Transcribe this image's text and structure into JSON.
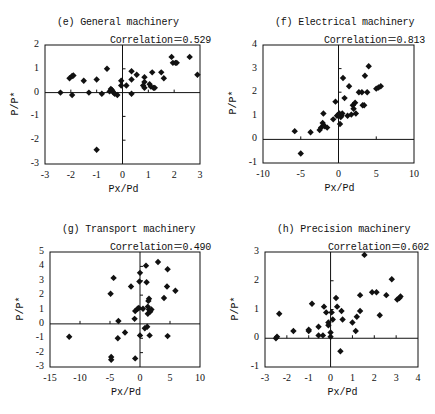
{
  "chart_data": [
    {
      "id": "e",
      "type": "scatter",
      "title": "(e) General machinery",
      "annotation": "Correlation＝0.529",
      "xlabel": "Px/Pd",
      "ylabel": "P/P*",
      "xlim": [
        -3,
        3
      ],
      "ylim": [
        -3,
        2
      ],
      "xticks": [
        -3,
        -2,
        -1,
        0,
        1,
        2,
        3
      ],
      "yticks": [
        -3,
        -2,
        -1,
        0,
        1,
        2
      ],
      "grid": false,
      "frame": {
        "left": 45,
        "top": 45,
        "right": 200,
        "bottom": 164
      },
      "points": [
        [
          -2.4,
          0.0
        ],
        [
          -2.05,
          0.6
        ],
        [
          -1.95,
          0.7
        ],
        [
          -1.9,
          0.72
        ],
        [
          -1.95,
          -0.1
        ],
        [
          -1.5,
          0.5
        ],
        [
          -1.3,
          0.0
        ],
        [
          -1.0,
          0.55
        ],
        [
          -0.8,
          -0.05
        ],
        [
          -0.6,
          1.0
        ],
        [
          -0.5,
          0.05
        ],
        [
          -0.45,
          0.15
        ],
        [
          -0.4,
          0.1
        ],
        [
          -0.35,
          0.0
        ],
        [
          -0.3,
          -0.05
        ],
        [
          -0.2,
          -0.1
        ],
        [
          -0.05,
          0.3
        ],
        [
          -0.05,
          0.5
        ],
        [
          0.35,
          0.9
        ],
        [
          0.35,
          0.55
        ],
        [
          0.35,
          -0.05
        ],
        [
          0.55,
          0.75
        ],
        [
          0.85,
          0.65
        ],
        [
          0.85,
          0.45
        ],
        [
          0.8,
          0.3
        ],
        [
          0.85,
          0.2
        ],
        [
          1.05,
          0.35
        ],
        [
          1.1,
          0.25
        ],
        [
          1.15,
          0.85
        ],
        [
          1.2,
          0.2
        ],
        [
          1.25,
          0.2
        ],
        [
          1.5,
          0.85
        ],
        [
          1.6,
          0.6
        ],
        [
          1.9,
          1.5
        ],
        [
          1.95,
          1.25
        ],
        [
          2.05,
          1.25
        ],
        [
          2.1,
          1.25
        ],
        [
          2.6,
          1.5
        ],
        [
          2.9,
          0.75
        ],
        [
          -1.0,
          -2.4
        ],
        [
          0.15,
          0.3
        ]
      ]
    },
    {
      "id": "f",
      "type": "scatter",
      "title": "(f) Electrical machinery",
      "annotation": "Correlation＝0.813",
      "xlabel": "Px/Pd",
      "ylabel": "P/P*",
      "xlim": [
        -10,
        10
      ],
      "ylim": [
        -1,
        4
      ],
      "xticks": [
        -10,
        -5,
        0,
        5,
        10
      ],
      "yticks": [
        -1,
        0,
        1,
        2,
        3,
        4
      ],
      "grid": false,
      "frame": {
        "left": 263,
        "top": 45,
        "right": 414,
        "bottom": 163
      },
      "points": [
        [
          -5.8,
          0.35
        ],
        [
          -5.0,
          -0.6
        ],
        [
          -3.7,
          0.3
        ],
        [
          -2.5,
          0.4
        ],
        [
          -2.3,
          0.5
        ],
        [
          -2.1,
          0.7
        ],
        [
          -2.0,
          0.6
        ],
        [
          -1.8,
          0.55
        ],
        [
          -1.5,
          0.5
        ],
        [
          -2.0,
          1.1
        ],
        [
          -0.7,
          0.85
        ],
        [
          -0.4,
          1.6
        ],
        [
          -0.2,
          1.0
        ],
        [
          0.0,
          1.05
        ],
        [
          0.2,
          0.65
        ],
        [
          0.3,
          0.95
        ],
        [
          0.5,
          1.1
        ],
        [
          0.4,
          1.0
        ],
        [
          0.8,
          1.75
        ],
        [
          0.6,
          2.6
        ],
        [
          1.2,
          1.0
        ],
        [
          1.4,
          2.25
        ],
        [
          1.7,
          1.05
        ],
        [
          1.9,
          1.45
        ],
        [
          2.0,
          1.3
        ],
        [
          2.2,
          1.55
        ],
        [
          2.3,
          1.1
        ],
        [
          2.7,
          2.0
        ],
        [
          3.1,
          2.0
        ],
        [
          3.2,
          1.45
        ],
        [
          3.4,
          1.45
        ],
        [
          3.5,
          2.7
        ],
        [
          3.8,
          2.0
        ],
        [
          4.0,
          3.1
        ],
        [
          5.0,
          2.15
        ],
        [
          5.3,
          2.2
        ],
        [
          5.6,
          2.25
        ],
        [
          0.1,
          1.1
        ]
      ]
    },
    {
      "id": "g",
      "type": "scatter",
      "title": "(g) Transport machinery",
      "annotation": "Correlation＝0.490",
      "xlabel": "Px/Pd",
      "ylabel": "P/P*",
      "xlim": [
        -15,
        10
      ],
      "ylim": [
        -3,
        5
      ],
      "xticks": [
        -15,
        -10,
        -5,
        0,
        5,
        10
      ],
      "yticks": [
        -3,
        -2,
        -1,
        0,
        1,
        2,
        3,
        4,
        5
      ],
      "grid": false,
      "frame": {
        "left": 50,
        "top": 252,
        "right": 200,
        "bottom": 367
      },
      "points": [
        [
          -11.8,
          -0.9
        ],
        [
          -4.4,
          3.2
        ],
        [
          -4.9,
          2.1
        ],
        [
          -3.6,
          0.2
        ],
        [
          -3.7,
          -1.0
        ],
        [
          -2.5,
          -0.6
        ],
        [
          -4.8,
          -2.3
        ],
        [
          -4.8,
          -2.5
        ],
        [
          -1.5,
          2.6
        ],
        [
          -0.8,
          0.9
        ],
        [
          -0.9,
          0.35
        ],
        [
          -0.8,
          -2.4
        ],
        [
          -0.4,
          1.05
        ],
        [
          -0.2,
          1.1
        ],
        [
          -0.1,
          2.95
        ],
        [
          0.0,
          3.55
        ],
        [
          0.0,
          -0.8
        ],
        [
          0.5,
          1.05
        ],
        [
          0.8,
          -0.3
        ],
        [
          1.0,
          4.05
        ],
        [
          1.1,
          2.9
        ],
        [
          1.2,
          -0.2
        ],
        [
          1.3,
          0.7
        ],
        [
          1.4,
          1.6
        ],
        [
          1.5,
          1.75
        ],
        [
          1.5,
          1.0
        ],
        [
          1.6,
          -0.8
        ],
        [
          1.7,
          0.85
        ],
        [
          1.9,
          1.0
        ],
        [
          3.0,
          4.3
        ],
        [
          4.0,
          1.8
        ],
        [
          4.5,
          2.6
        ],
        [
          4.6,
          3.8
        ],
        [
          4.6,
          -0.85
        ],
        [
          5.9,
          2.3
        ],
        [
          1.3,
          1.2
        ]
      ]
    },
    {
      "id": "h",
      "type": "scatter",
      "title": "(h) Precision machinery",
      "annotation": "Correlation＝0.602",
      "xlabel": "Px/Pd",
      "ylabel": "P/P*",
      "xlim": [
        -3,
        4
      ],
      "ylim": [
        -1,
        3
      ],
      "xticks": [
        -3,
        -2,
        -1,
        0,
        1,
        2,
        3,
        4
      ],
      "yticks": [
        -1,
        0,
        1,
        2,
        3
      ],
      "grid": false,
      "frame": {
        "left": 265,
        "top": 252,
        "right": 418,
        "bottom": 367
      },
      "points": [
        [
          -2.5,
          0.0
        ],
        [
          -2.45,
          0.05
        ],
        [
          -2.35,
          0.85
        ],
        [
          -1.7,
          0.25
        ],
        [
          -1.0,
          0.25
        ],
        [
          -1.0,
          0.3
        ],
        [
          -0.85,
          1.2
        ],
        [
          -0.55,
          0.4
        ],
        [
          -0.55,
          0.1
        ],
        [
          -0.35,
          0.1
        ],
        [
          -0.3,
          1.1
        ],
        [
          -0.2,
          0.9
        ],
        [
          -0.1,
          0.55
        ],
        [
          -0.1,
          0.45
        ],
        [
          0.0,
          0.05
        ],
        [
          0.0,
          0.2
        ],
        [
          0.05,
          0.9
        ],
        [
          0.1,
          0.65
        ],
        [
          0.25,
          1.4
        ],
        [
          0.3,
          1.1
        ],
        [
          0.5,
          0.95
        ],
        [
          0.55,
          0.65
        ],
        [
          0.45,
          -0.45
        ],
        [
          1.0,
          0.55
        ],
        [
          1.15,
          0.25
        ],
        [
          1.2,
          0.75
        ],
        [
          1.35,
          0.95
        ],
        [
          1.35,
          1.5
        ],
        [
          1.55,
          2.9
        ],
        [
          1.9,
          1.6
        ],
        [
          2.1,
          1.6
        ],
        [
          2.25,
          0.8
        ],
        [
          2.55,
          1.5
        ],
        [
          2.8,
          2.05
        ],
        [
          3.05,
          1.35
        ],
        [
          3.15,
          1.4
        ],
        [
          3.2,
          1.45
        ]
      ]
    }
  ]
}
